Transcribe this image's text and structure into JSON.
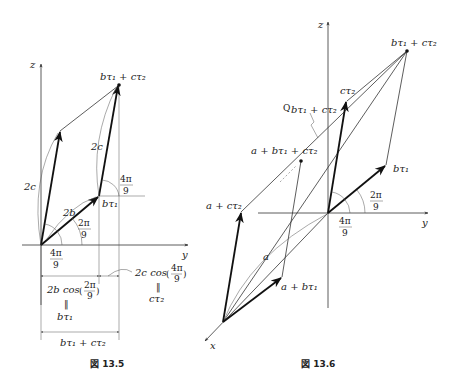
{
  "figures": [
    {
      "caption": "図 13.5",
      "axes": {
        "z": "z",
        "y": "y"
      },
      "labels": {
        "sum": "bτ₁ + cτ₂",
        "b_tau1": "bτ₁",
        "two_b": "2b",
        "two_c_left": "2c",
        "two_c_right": "2c",
        "angle_2pi9_num": "2π",
        "angle_2pi9_den": "9",
        "angle_4pi9_num": "4π",
        "angle_4pi9_den": "9",
        "angle_4pi9_top_num": "4π",
        "angle_4pi9_top_den": "9",
        "dim1_expr_pre": "2b cos",
        "dim1_frac_num": "2π",
        "dim1_frac_den": "9",
        "dim1_eq": "‖",
        "dim1_result": "bτ₁",
        "dim2_expr_pre": "2c cos",
        "dim2_frac_num": "4π",
        "dim2_frac_den": "9",
        "dim2_eq": "‖",
        "dim2_result": "cτ₂",
        "dim_total": "bτ₁ + cτ₂"
      }
    },
    {
      "caption": "図 13.6",
      "axes": {
        "z": "z",
        "y": "y",
        "x": "x"
      },
      "labels": {
        "sum": "bτ₁ + cτ₂",
        "c_tau2": "cτ₂",
        "b_tau1": "bτ₁",
        "q_label": "Q",
        "q_sub": "bτ₁ + cτ₂",
        "a_b_c": "a + bτ₁ + cτ₂",
        "a_c": "a + cτ₂",
        "a_b": "a + bτ₁",
        "a": "a",
        "angle_2pi9_num": "2π",
        "angle_2pi9_den": "9",
        "angle_4pi9_num": "4π",
        "angle_4pi9_den": "9"
      }
    }
  ]
}
